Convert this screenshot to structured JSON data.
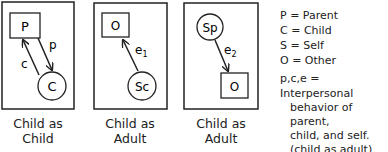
{
  "panels": [
    {
      "caption_line1": "Child as",
      "caption_line2": "Child",
      "box_label": "P",
      "circle_label": "C",
      "arrow_labels": [
        "p",
        "c"
      ]
    },
    {
      "caption_line1": "Child as",
      "caption_line2": "Adult",
      "box_label": "O",
      "circle_label": "Sc",
      "arrow_label": "e",
      "arrow_sub": "1"
    },
    {
      "caption_line1": "Child as",
      "caption_line2": "Adult",
      "box_label": "O",
      "circle_label": "Sp",
      "arrow_label": "e",
      "arrow_sub": "2"
    }
  ],
  "legend": {
    "lines": [
      "P = Parent",
      "C = Child",
      "S = Self",
      "O = Other"
    ],
    "def_line": "p,c,e = Interpersonal",
    "def_cont": [
      "behavior of parent,",
      "child, and self.",
      "(child as adult)"
    ]
  }
}
